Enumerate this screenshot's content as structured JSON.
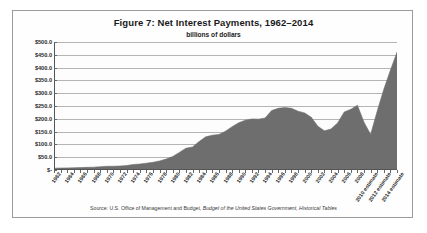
{
  "figure": {
    "title": "Figure 7: Net Interest Payments, 1962–2014",
    "subtitle": "billions of dollars",
    "source_prefix": "Source: U.S. Office of Management and Budget, ",
    "source_italic": "Budget of the United States Government, Historical Tables",
    "source_full": "Source: U.S. Office of Management and Budget, Budget of the United States Government, Historical Tables"
  },
  "style": {
    "area_fill": "#6e6e6e",
    "gridline": "#b4b4b4",
    "axis": "#555555",
    "frame_border": "#9a9a9a",
    "text": "#1a1a1a",
    "background": "#ffffff"
  },
  "chart_data": {
    "type": "area",
    "title": "Figure 7: Net Interest Payments, 1962–2014",
    "subtitle": "billions of dollars",
    "xlabel": "",
    "ylabel": "billions of dollars",
    "ylim": [
      0,
      500
    ],
    "ytick_step": 50,
    "grid": true,
    "legend": false,
    "ytick_labels": [
      "$500.0",
      "$450.0",
      "$400.0",
      "$350.0",
      "$300.0",
      "$250.0",
      "$200.0",
      "$150.0",
      "$100.0",
      "$50.0",
      "$-"
    ],
    "ytick_values": [
      500,
      450,
      400,
      350,
      300,
      250,
      200,
      150,
      100,
      50,
      0
    ],
    "xtick_labels": [
      "1962",
      "1964",
      "1966",
      "1968",
      "1970",
      "1972",
      "1974",
      "1976",
      "1978",
      "1980",
      "1982",
      "1984",
      "1986",
      "1988",
      "1990",
      "1992",
      "1994",
      "1996",
      "1998",
      "2000",
      "2002",
      "2004",
      "2006",
      "2008",
      "2010 estimate",
      "2012 estimate",
      "2014 estimate"
    ],
    "xtick_values": [
      1962,
      1964,
      1966,
      1968,
      1970,
      1972,
      1974,
      1976,
      1978,
      1980,
      1982,
      1984,
      1986,
      1988,
      1990,
      1992,
      1994,
      1996,
      1998,
      2000,
      2002,
      2004,
      2006,
      2008,
      2010,
      2012,
      2014
    ],
    "x": [
      1962,
      1963,
      1964,
      1965,
      1966,
      1967,
      1968,
      1969,
      1970,
      1971,
      1972,
      1973,
      1974,
      1975,
      1976,
      1977,
      1978,
      1979,
      1980,
      1981,
      1982,
      1983,
      1984,
      1985,
      1986,
      1987,
      1988,
      1989,
      1990,
      1991,
      1992,
      1993,
      1994,
      1995,
      1996,
      1997,
      1998,
      1999,
      2000,
      2001,
      2002,
      2003,
      2004,
      2005,
      2006,
      2007,
      2008,
      2009,
      2010,
      2011,
      2012,
      2013,
      2014
    ],
    "values": [
      6.9,
      7.7,
      8.2,
      8.6,
      9.4,
      10.3,
      11.1,
      12.7,
      14.4,
      14.8,
      15.5,
      17.3,
      21.4,
      23.2,
      26.7,
      29.9,
      35.5,
      42.6,
      52.5,
      68.8,
      85.0,
      89.8,
      111.1,
      129.5,
      136.0,
      138.7,
      151.8,
      169.3,
      184.3,
      194.5,
      199.4,
      198.7,
      203.0,
      232.2,
      241.1,
      244.0,
      241.1,
      229.8,
      222.9,
      206.2,
      170.9,
      153.1,
      160.2,
      184.0,
      226.6,
      237.1,
      252.8,
      186.9,
      138.7,
      230.0,
      315.0,
      390.0,
      460.0
    ],
    "series_name": "Net interest payments",
    "unit": "billions of dollars"
  }
}
